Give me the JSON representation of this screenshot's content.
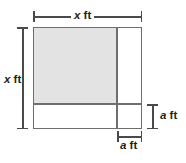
{
  "figure": {
    "name": "square-with-inset-corner-diagram",
    "colors": {
      "shaded_fill": "#e3e3e3",
      "outline": "#6e6e6e",
      "dimension_line": "#4a4a4a",
      "label_text": "#231f20",
      "background": "#ffffff"
    },
    "labels": {
      "top": {
        "variable": "x",
        "unit": "ft",
        "full": "x ft"
      },
      "left": {
        "variable": "x",
        "unit": "ft",
        "full": "x ft"
      },
      "right": {
        "variable": "a",
        "unit": "ft",
        "full": "a ft"
      },
      "bottom": {
        "variable": "a",
        "unit": "ft",
        "full": "a ft"
      }
    },
    "regions": [
      {
        "name": "shaded-inner-rectangle",
        "fill": "shaded",
        "position": "top-left"
      },
      {
        "name": "right-strip",
        "fill": "white",
        "position": "right"
      },
      {
        "name": "bottom-strip",
        "fill": "white",
        "position": "bottom"
      },
      {
        "name": "corner-square",
        "fill": "white",
        "position": "bottom-right"
      }
    ]
  }
}
